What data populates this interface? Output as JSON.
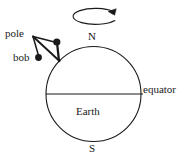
{
  "figure": {
    "background_color": "#ffffff",
    "stroke_color": "#1a1a1a",
    "labels": {
      "pole": "pole",
      "bob": "bob",
      "north": "N",
      "south": "S",
      "equator": "equator",
      "earth": "Earth"
    },
    "geometry": {
      "earth_circle": {
        "cx": 93.5,
        "cy": 94,
        "r": 47.5
      },
      "equator_line": {
        "x1": 46,
        "y1": 94,
        "x2": 141,
        "y2": 94
      },
      "rotation_arrow": {
        "cx": 92.5,
        "cy": 16,
        "rx": 22.5,
        "ry": 8
      },
      "pendulum_anchor": {
        "x": 59,
        "y": 60.5
      },
      "pendulum_bob_dot": {
        "x": 56.5,
        "y": 42
      },
      "bob_label_dot": {
        "x": 38.5,
        "y": 57.5
      },
      "pole_leader_origin": {
        "x": 32,
        "y": 36
      }
    },
    "icons": {
      "rotation": "rotation-arrow-icon",
      "bob_marker": "filled-dot-icon"
    }
  }
}
